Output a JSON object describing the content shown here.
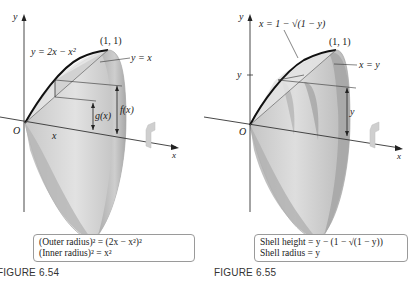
{
  "figures": [
    {
      "id": "6.54",
      "title": "FIGURE 6.54",
      "axis_labels": {
        "y": "y",
        "x": "x",
        "origin": "O"
      },
      "curve_label": "y = 2x − x²",
      "line_label": "y = x",
      "point_label": "(1, 1)",
      "dimension_labels": {
        "outer": "f(x)",
        "inner": "g(x)",
        "position": "x"
      },
      "caption_lines": [
        "(Outer radius)² = (2x − x²)²",
        "(Inner radius)² = x²"
      ],
      "icons": [
        "rotation-arrow-icon"
      ]
    },
    {
      "id": "6.55",
      "title": "FIGURE 6.55",
      "axis_labels": {
        "y": "y",
        "x": "x",
        "origin": "O",
        "y_tick": "y"
      },
      "curve_label": "x = 1 − √(1 − y)",
      "line_label": "x = y",
      "point_label": "(1, 1)",
      "dimension_labels": {
        "height": "y"
      },
      "caption_lines": [
        "Shell height = y − (1 − √(1 − y))",
        "Shell radius = y"
      ],
      "icons": [
        "rotation-arrow-icon"
      ]
    }
  ],
  "colors": {
    "solid_light": "#d9d9d9",
    "solid_mid": "#bdbdbd",
    "solid_dark": "#9e9e9e",
    "curve": "#111111",
    "axis": "#333333",
    "caption_border": "#9a9a9a",
    "title": "#333333"
  }
}
